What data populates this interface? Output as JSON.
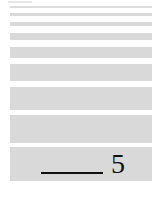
{
  "bands": [
    {
      "name": "band-1"
    },
    {
      "name": "band-2"
    },
    {
      "name": "band-3"
    },
    {
      "name": "band-4"
    },
    {
      "name": "band-5"
    },
    {
      "name": "band-6"
    },
    {
      "name": "band-7"
    },
    {
      "name": "band-8"
    },
    {
      "name": "band-9"
    },
    {
      "name": "band-10"
    }
  ],
  "answer_line": {
    "number": "5"
  }
}
